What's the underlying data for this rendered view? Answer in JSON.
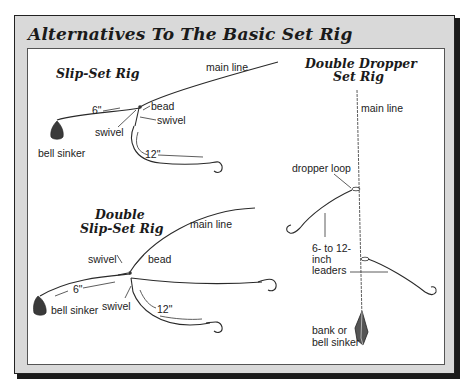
{
  "figure": {
    "title": "Alternatives To The Basic Set Rig",
    "colors": {
      "frame": "#d9d9d9",
      "shadow": "#1a1a1a",
      "panel": "#ffffff",
      "ink": "#222222"
    }
  },
  "rigs": {
    "slip_set": {
      "heading": "Slip-Set Rig",
      "labels": {
        "main_line": "main line",
        "leader_short": "6\"",
        "bead": "bead",
        "swivel_left": "swivel",
        "swivel_right": "swivel",
        "bell_sinker": "bell sinker",
        "leader_long": "12\""
      },
      "icons": [
        "bell-sinker-icon",
        "hook-icon"
      ]
    },
    "double_slip_set": {
      "heading_line1": "Double",
      "heading_line2": "Slip-Set Rig",
      "labels": {
        "main_line": "main line",
        "swivel_top": "swivel",
        "bead": "bead",
        "leader_short": "6\"",
        "bell_sinker": "bell sinker",
        "swivel_bottom": "swivel",
        "leader_long": "12\""
      },
      "icons": [
        "bell-sinker-icon",
        "hook-icon",
        "hook-icon"
      ]
    },
    "double_dropper": {
      "heading_line1": "Double Dropper",
      "heading_line2": "Set Rig",
      "labels": {
        "main_line": "main line",
        "dropper_loop": "dropper loop",
        "leaders_line1": "6- to 12-",
        "leaders_line2": "inch",
        "leaders_line3": "leaders",
        "sinker_line1": "bank or",
        "sinker_line2": "bell sinker"
      },
      "icons": [
        "hook-icon",
        "hook-icon",
        "bank-sinker-icon"
      ]
    }
  }
}
